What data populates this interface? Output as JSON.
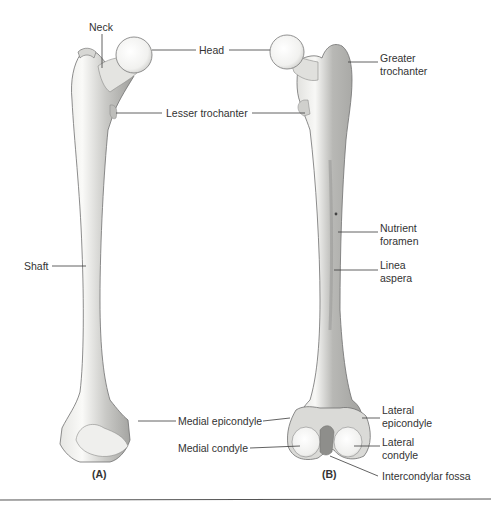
{
  "figure": {
    "panels": [
      {
        "id": "A",
        "label": "(A)"
      },
      {
        "id": "B",
        "label": "(B)"
      }
    ],
    "colors": {
      "bone_light": "#f4f4f2",
      "bone_mid": "#d9d9d6",
      "bone_shadow": "#a9a9a6",
      "outline": "#6e6e6c",
      "leader_line": "#3a3a3a",
      "text": "#333333",
      "background": "#ffffff"
    }
  },
  "labels": {
    "neck": "Neck",
    "head": "Head",
    "greater_trochanter": "Greater\ntrochanter",
    "lesser_trochanter": "Lesser trochanter",
    "nutrient_foramen": "Nutrient\nforamen",
    "shaft": "Shaft",
    "linea_aspera": "Linea\naspera",
    "medial_epicondyle": "Medial epicondyle",
    "lateral_epicondyle": "Lateral\nepicondyle",
    "medial_condyle": "Medial condyle",
    "lateral_condyle": "Lateral\ncondyle",
    "intercondylar_fossa": "Intercondylar fossa"
  }
}
